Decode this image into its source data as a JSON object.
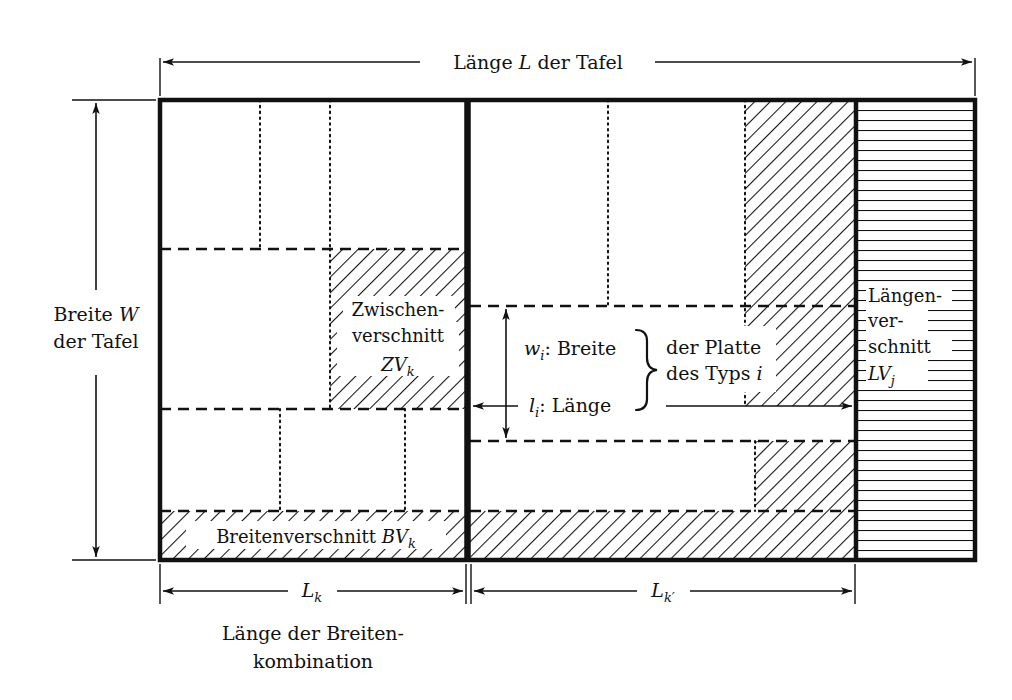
{
  "diagram": {
    "title_top": "Länge L der Tafel",
    "title_top_parts": {
      "pre": "Länge ",
      "sym": "L",
      "post": " der Tafel"
    },
    "left_axis": {
      "line1_pre": "Breite ",
      "line1_sym": "W",
      "line2": "der Tafel"
    },
    "zwischenverschnitt": {
      "line1": "Zwischen-",
      "line2": "verschnitt",
      "sym": "ZV",
      "sub": "k"
    },
    "breitenverschnitt": {
      "text": "Breitenverschnitt ",
      "sym": "BV",
      "sub": "k"
    },
    "laengenverschnitt": {
      "line1": "Längen-",
      "line2": "ver-",
      "line3": "schnitt",
      "sym": "LV",
      "sub": "j"
    },
    "plate_dims": {
      "width_sym": "w",
      "width_sub": "i",
      "width_label": ": Breite",
      "length_sym": "l",
      "length_sub": "i",
      "length_label": ": Länge",
      "brace_line1": "der Platte",
      "brace_line2_pre": "des Typs ",
      "brace_line2_sym": "i"
    },
    "bottom_dims": {
      "lk_sym": "L",
      "lk_sub": "k",
      "lkp_sym": "L",
      "lkp_sub": "k′"
    },
    "caption": {
      "line1": "Länge der Breiten-",
      "line2": "kombination"
    }
  },
  "colors": {
    "ink": "#111111",
    "paper": "#ffffff"
  }
}
